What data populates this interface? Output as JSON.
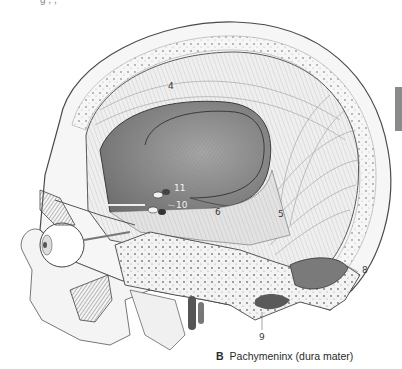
{
  "figure": {
    "caption_letter": "B",
    "caption_text": "Pachymeninx (dura mater)",
    "top_cut_text": "g     ,       ,"
  },
  "callouts": [
    {
      "id": "4",
      "label": "4",
      "x": 168,
      "y": 82
    },
    {
      "id": "5",
      "label": "5",
      "x": 278,
      "y": 210
    },
    {
      "id": "6",
      "label": "6",
      "x": 215,
      "y": 208
    },
    {
      "id": "8",
      "label": "8",
      "x": 362,
      "y": 266
    },
    {
      "id": "9",
      "label": "9",
      "x": 259,
      "y": 333
    },
    {
      "id": "10",
      "label": "10",
      "x": 176,
      "y": 203
    },
    {
      "id": "11",
      "label": "11",
      "x": 174,
      "y": 186
    }
  ],
  "colors": {
    "skull_fill": "#f4f4f4",
    "skull_edge": "#4a4a4a",
    "dura_fill": "#ececec",
    "dura_lines": "#9a9a9a",
    "cavity_fill": "#8f8f8f",
    "cavity_dark": "#6b6b6b",
    "side_tab": "#8a8a8a"
  }
}
